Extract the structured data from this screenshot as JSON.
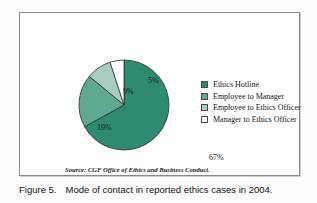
{
  "figure": {
    "caption_label": "Figure 5.",
    "caption_text": "Mode of contact in reported ethics cases in 2004.",
    "source": "Source: CGF Office of Ethics and Business Conduct."
  },
  "chart_data": {
    "type": "pie",
    "title": "",
    "categories": [
      "Ethics Hotline",
      "Employee to Manager",
      "Employee to Ethics Officer",
      "Manager to Ethics Officer"
    ],
    "values": [
      67,
      19,
      9,
      5
    ],
    "value_labels": [
      "67%",
      "19%",
      "9%",
      "5%"
    ],
    "unit": "percent",
    "colors": [
      "#2e8b72",
      "#5fa992",
      "#a9cdc0",
      "#ffffff"
    ],
    "slice_border_color": "#2f2f2f",
    "legend_position": "right",
    "grid": false,
    "start_angle_deg": 0,
    "direction": "clockwise"
  },
  "legend": {
    "items": [
      {
        "label": "Ethics Hotline",
        "color": "#2e8b72"
      },
      {
        "label": "Employee to Manager",
        "color": "#5fa992"
      },
      {
        "label": "Employee to Ethics Officer",
        "color": "#a9cdc0"
      },
      {
        "label": "Manager to Ethics Officer",
        "color": "#ffffff"
      }
    ]
  }
}
